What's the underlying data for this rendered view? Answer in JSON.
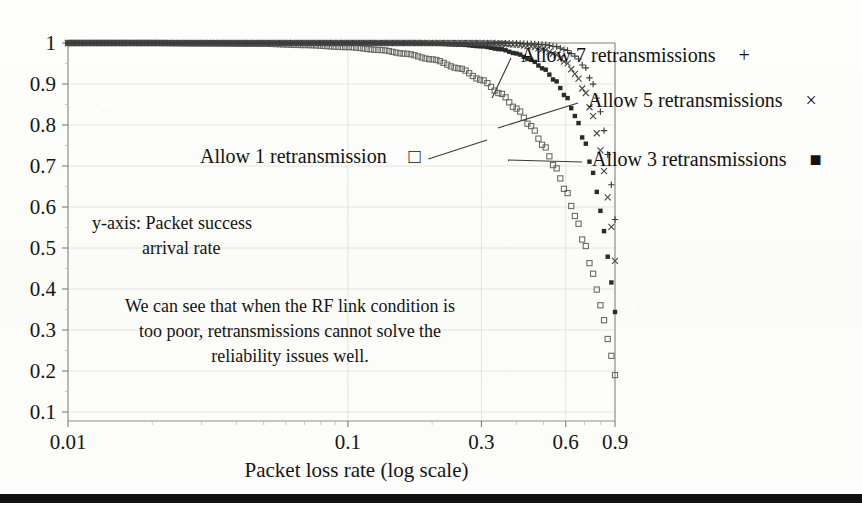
{
  "figure": {
    "background_color": "#fdfdfb",
    "ink_color": "#151515",
    "frame_color": "#8d8d8d",
    "bottom_rule": true
  },
  "axes": {
    "x_title": "Packet loss rate (log scale)",
    "x_scale": "log",
    "x_ticks": [
      "0.01",
      "0.1",
      "0.3",
      "0.6",
      "0.9"
    ],
    "x_tick_values": [
      0.01,
      0.1,
      0.3,
      0.6,
      0.9
    ],
    "x_range": [
      0.01,
      0.9
    ],
    "y_ticks": [
      "1",
      "0.9",
      "0.8",
      "0.7",
      "0.6",
      "0.5",
      "0.4",
      "0.3",
      "0.2",
      "0.1"
    ],
    "y_tick_values": [
      1,
      0.9,
      0.8,
      0.7,
      0.6,
      0.5,
      0.4,
      0.3,
      0.2,
      0.1
    ],
    "y_range": [
      0.1,
      1.0
    ],
    "grid": true
  },
  "annotations": {
    "y_axis_note_line1": "y-axis: Packet success",
    "y_axis_note_line2": "arrival rate",
    "conclusion_line1": "We can see that when the RF link condition is",
    "conclusion_line2": "too poor, retransmissions cannot solve the",
    "conclusion_line3": "reliability issues well."
  },
  "legend": {
    "position": "in-plot-callouts",
    "entries": [
      {
        "label": "Allow 1 retransmission",
        "marker": "open-square",
        "marker_glyph": "□",
        "retransmissions": 1
      },
      {
        "label": "Allow 3 retransmissions",
        "marker": "filled-square",
        "marker_glyph": "■",
        "retransmissions": 3
      },
      {
        "label": "Allow 5 retransmissions",
        "marker": "cross-x",
        "marker_glyph": "×",
        "retransmissions": 5
      },
      {
        "label": "Allow 7 retransmissions",
        "marker": "plus",
        "marker_glyph": "+",
        "retransmissions": 7
      }
    ]
  },
  "chart_data": {
    "type": "line",
    "title": "",
    "xlabel": "Packet loss rate (log scale)",
    "ylabel": "Packet success arrival rate",
    "xscale": "log",
    "xlim": [
      0.01,
      0.9
    ],
    "ylim": [
      0.1,
      1.0
    ],
    "grid": true,
    "legend_position": "callouts",
    "x": [
      0.01,
      0.02,
      0.03,
      0.05,
      0.07,
      0.1,
      0.13,
      0.16,
      0.2,
      0.25,
      0.3,
      0.35,
      0.4,
      0.45,
      0.5,
      0.55,
      0.6,
      0.65,
      0.7,
      0.75,
      0.8,
      0.85,
      0.9
    ],
    "series": [
      {
        "name": "Allow 1 retransmission",
        "marker": "open-square",
        "values": [
          1.0,
          1.0,
          0.999,
          0.998,
          0.995,
          0.99,
          0.983,
          0.974,
          0.96,
          0.938,
          0.91,
          0.877,
          0.84,
          0.7975,
          0.75,
          0.6975,
          0.64,
          0.5775,
          0.51,
          0.4375,
          0.36,
          0.2775,
          0.19
        ]
      },
      {
        "name": "Allow 3 retransmissions",
        "marker": "filled-square",
        "values": [
          1.0,
          1.0,
          1.0,
          1.0,
          1.0,
          0.9999,
          0.9997,
          0.9993,
          0.9984,
          0.9961,
          0.9919,
          0.985,
          0.9744,
          0.959,
          0.9375,
          0.9085,
          0.8704,
          0.8215,
          0.7599,
          0.6836,
          0.5904,
          0.478,
          0.3439
        ]
      },
      {
        "name": "Allow 5 retransmissions",
        "marker": "cross-x",
        "values": [
          1.0,
          1.0,
          1.0,
          1.0,
          1.0,
          1.0,
          1.0,
          1.0,
          0.9999,
          0.9998,
          0.9993,
          0.9982,
          0.9959,
          0.9917,
          0.9844,
          0.9728,
          0.9533,
          0.9246,
          0.8824,
          0.822,
          0.7379,
          0.6229,
          0.4686
        ]
      },
      {
        "name": "Allow 7 retransmissions",
        "marker": "plus",
        "values": [
          1.0,
          1.0,
          1.0,
          1.0,
          1.0,
          1.0,
          1.0,
          1.0,
          1.0,
          1.0,
          0.9999,
          0.9998,
          0.9993,
          0.9983,
          0.9961,
          0.9917,
          0.9832,
          0.9679,
          0.9424,
          0.8999,
          0.8322,
          0.7275,
          0.5695
        ]
      }
    ],
    "callouts": [
      {
        "label": "Allow 7 retransmissions",
        "marker_glyph": "+",
        "text_x": 521,
        "text_y": 62,
        "point_x": 492,
        "point_y": 98
      },
      {
        "label": "Allow 5 retransmissions",
        "marker_glyph": "×",
        "text_x": 588,
        "text_y": 107,
        "point_x": 498,
        "point_y": 128
      },
      {
        "label": "Allow 3 retransmissions",
        "marker_glyph": "■",
        "text_x": 592,
        "text_y": 166,
        "point_x": 508,
        "point_y": 160
      },
      {
        "label": "Allow 1 retransmission",
        "marker_glyph": "□",
        "text_x": 200,
        "text_y": 163,
        "point_x": 487,
        "point_y": 140
      }
    ]
  }
}
